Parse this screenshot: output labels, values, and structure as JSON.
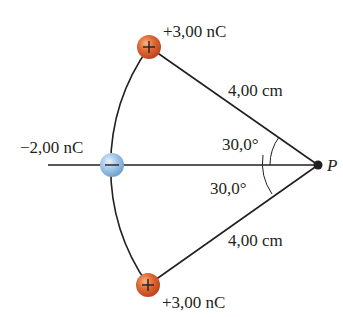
{
  "diagram": {
    "charges": {
      "top": {
        "label": "+3,00 nC",
        "sign": "+",
        "color": "#d9562a"
      },
      "middle": {
        "label": "−2,00 nC",
        "sign": "−",
        "color": "#8fb8e0"
      },
      "bottom": {
        "label": "+3,00 nC",
        "sign": "+",
        "color": "#d9562a"
      }
    },
    "distances": {
      "top": "4,00 cm",
      "bottom": "4,00 cm"
    },
    "angles": {
      "upper": "30,0°",
      "lower": "30,0°"
    },
    "point": {
      "label": "P"
    },
    "colors": {
      "line": "#231f20",
      "positive": "#d9562a",
      "negative": "#8fb8e0"
    }
  }
}
